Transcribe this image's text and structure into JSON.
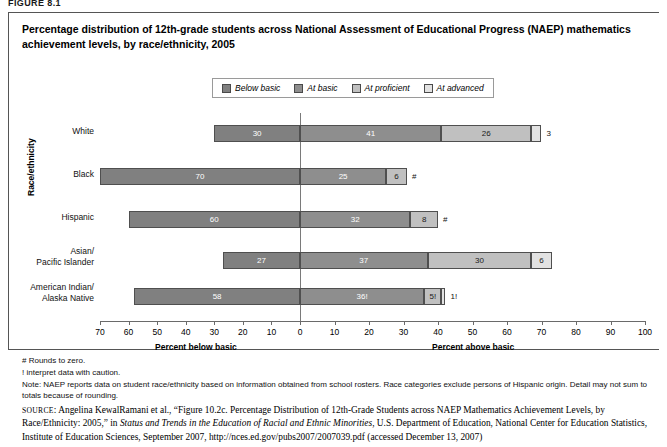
{
  "figure_label": "FIGURE 8.1",
  "title": "Percentage distribution of 12th-grade students across National Assessment of Educational Progress (NAEP) mathematics achievement levels, by race/ethnicity, 2005",
  "y_axis_title": "Race/ethnicity",
  "axis_titles": {
    "left": "Percent below basic",
    "right": "Percent above basic"
  },
  "notes": [
    "# Rounds to zero.",
    "! interpret data with caution.",
    "Note: NAEP reports data on student race/ethnicity based on information obtained from school rosters. Race categories exclude persons of Hispanic origin. Detail may not sum to totals because of rounding."
  ],
  "source_prefix": "SOURCE",
  "source_text_1": ": Angelina KewalRamani et al., “Figure 10.2c. Percentage Distribution of 12th-Grade Students across NAEP Mathematics Achievement Levels, by Race/Ethnicity: 2005,” in ",
  "source_italic": "Status and Trends in the Education of Racial and Ethnic Minorities",
  "source_text_2": ", U.S. Department of Education, National Center for Education Statistics, Institute of Education Sciences, September 2007, http://nces.ed.gov/pubs2007/2007039.pdf (accessed December 13, 2007)",
  "chart_data": {
    "type": "bar",
    "subtype": "diverging-stacked-horizontal",
    "title": "Percentage distribution of 12th-grade students across National Assessment of Educational Progress (NAEP) mathematics achievement levels, by race/ethnicity, 2005",
    "xlabel": "Percent",
    "ylabel": "Race/ethnicity",
    "grid": false,
    "legend_position": "top-center",
    "axis_left_range": [
      70,
      0
    ],
    "axis_right_range": [
      0,
      100
    ],
    "left_ticks": [
      70,
      60,
      50,
      40,
      30,
      20,
      10
    ],
    "right_ticks": [
      0,
      10,
      20,
      30,
      40,
      50,
      60,
      70,
      80,
      90,
      100
    ],
    "zero_at": "boundary between Below basic and At basic",
    "categories": [
      "White",
      "Black",
      "Hispanic",
      "Asian/ Pacific Islander",
      "American Indian/ Alaska Native"
    ],
    "series": [
      {
        "name": "Below basic",
        "color": "#808080",
        "values": [
          30,
          70,
          60,
          27,
          58
        ],
        "labels": [
          "30",
          "70",
          "60",
          "27",
          "58"
        ]
      },
      {
        "name": "At basic",
        "color": "#8e8e8e",
        "values": [
          41,
          25,
          32,
          37,
          36
        ],
        "labels": [
          "41",
          "25",
          "32",
          "37",
          "36!"
        ]
      },
      {
        "name": "At proficient",
        "color": "#c0c0c0",
        "values": [
          26,
          6,
          8,
          30,
          5
        ],
        "labels": [
          "26",
          "6",
          "8",
          "30",
          "5!"
        ]
      },
      {
        "name": "At advanced",
        "color": "#e2e2e2",
        "values": [
          3,
          0,
          0,
          6,
          1
        ],
        "labels": [
          "3",
          "#",
          "#",
          "6",
          "1!"
        ]
      }
    ],
    "footnote_symbols": {
      "#": "Rounds to zero.",
      "!": "interpret data with caution."
    }
  },
  "legend": {
    "items": [
      {
        "label": "Below basic",
        "color": "#808080"
      },
      {
        "label": "At basic",
        "color": "#8e8e8e"
      },
      {
        "label": "At proficient",
        "color": "#c0c0c0"
      },
      {
        "label": "At advanced",
        "color": "#e2e2e2"
      }
    ]
  }
}
